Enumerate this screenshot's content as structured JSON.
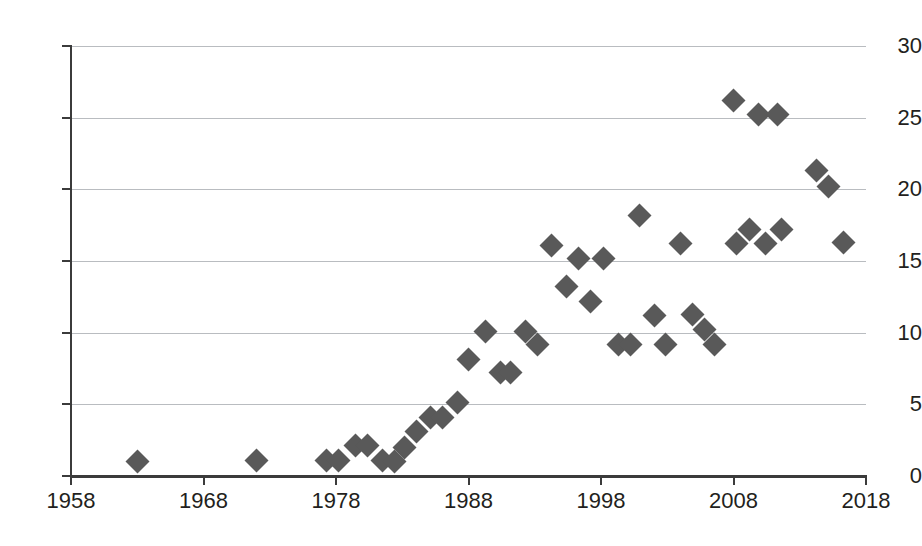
{
  "chart_data": {
    "type": "scatter",
    "title": "",
    "subtitle": "",
    "xlabel": "",
    "ylabel": "",
    "xlim": [
      1958,
      2018
    ],
    "ylim": [
      0,
      30
    ],
    "grid": true,
    "legend": null,
    "x_ticks": [
      1958,
      1968,
      1978,
      1988,
      1998,
      2008,
      2018
    ],
    "y_ticks": [
      0,
      5,
      10,
      15,
      20,
      25,
      30
    ],
    "x_tick_labels": [
      "1958",
      "1968",
      "1978",
      "1988",
      "1998",
      "2008",
      "2018"
    ],
    "y_tick_labels": [
      "0",
      "5",
      "10",
      "15",
      "20",
      "25",
      "30"
    ],
    "marker": "diamond",
    "marker_color": "#595959",
    "grid_color": "#b9bcc0",
    "axis_color": "#3b3b3b",
    "points": [
      {
        "x": 1963.0,
        "y": 1.0
      },
      {
        "x": 1972.0,
        "y": 1.1
      },
      {
        "x": 1977.3,
        "y": 1.1
      },
      {
        "x": 1978.2,
        "y": 1.1
      },
      {
        "x": 1979.5,
        "y": 2.1
      },
      {
        "x": 1980.4,
        "y": 2.1
      },
      {
        "x": 1981.5,
        "y": 1.1
      },
      {
        "x": 1982.4,
        "y": 1.0
      },
      {
        "x": 1983.2,
        "y": 2.0
      },
      {
        "x": 1984.1,
        "y": 3.1
      },
      {
        "x": 1985.1,
        "y": 4.1
      },
      {
        "x": 1986.0,
        "y": 4.1
      },
      {
        "x": 1987.2,
        "y": 5.1
      },
      {
        "x": 1988.0,
        "y": 8.1
      },
      {
        "x": 1989.3,
        "y": 10.1
      },
      {
        "x": 1990.4,
        "y": 7.2
      },
      {
        "x": 1991.2,
        "y": 7.2
      },
      {
        "x": 1992.3,
        "y": 10.1
      },
      {
        "x": 1993.2,
        "y": 9.2
      },
      {
        "x": 1994.3,
        "y": 16.1
      },
      {
        "x": 1995.4,
        "y": 13.2
      },
      {
        "x": 1996.3,
        "y": 15.2
      },
      {
        "x": 1997.2,
        "y": 12.2
      },
      {
        "x": 1998.2,
        "y": 15.2
      },
      {
        "x": 1999.3,
        "y": 9.2
      },
      {
        "x": 2000.2,
        "y": 9.2
      },
      {
        "x": 2000.9,
        "y": 18.2
      },
      {
        "x": 2002.0,
        "y": 11.2
      },
      {
        "x": 2002.9,
        "y": 9.2
      },
      {
        "x": 2004.0,
        "y": 16.2
      },
      {
        "x": 2004.9,
        "y": 11.3
      },
      {
        "x": 2005.8,
        "y": 10.2
      },
      {
        "x": 2006.6,
        "y": 9.2
      },
      {
        "x": 2008.0,
        "y": 26.2
      },
      {
        "x": 2008.2,
        "y": 16.2
      },
      {
        "x": 2009.2,
        "y": 17.2
      },
      {
        "x": 2009.9,
        "y": 25.2
      },
      {
        "x": 2010.4,
        "y": 16.2
      },
      {
        "x": 2011.3,
        "y": 25.2
      },
      {
        "x": 2011.6,
        "y": 17.2
      },
      {
        "x": 2014.3,
        "y": 21.3
      },
      {
        "x": 2015.2,
        "y": 20.2
      },
      {
        "x": 2016.3,
        "y": 16.3
      }
    ]
  }
}
